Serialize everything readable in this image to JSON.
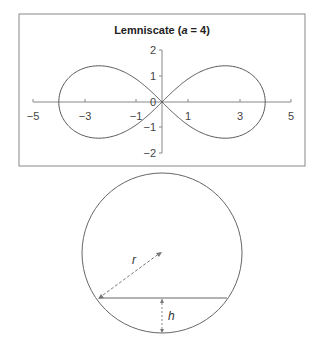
{
  "chart_data": {
    "type": "line",
    "title": "Lemniscate (a = 4)",
    "title_parts": {
      "prefix": "Lemniscate (",
      "var": "a",
      "suffix": " = 4)"
    },
    "parameter_a": 4,
    "equation": "(x^2 + y^2)^2 = a^2 (x^2 - y^2)",
    "xlim": [
      -5,
      5
    ],
    "ylim": [
      -2,
      2
    ],
    "x_ticks": [
      "−5",
      "−3",
      "−1",
      "1",
      "3",
      "5"
    ],
    "y_ticks": [
      "2",
      "1",
      "0",
      "−1",
      "−2"
    ],
    "grid": false,
    "legend": false
  },
  "circle_diagram": {
    "radius_label": "r",
    "height_label": "h"
  }
}
